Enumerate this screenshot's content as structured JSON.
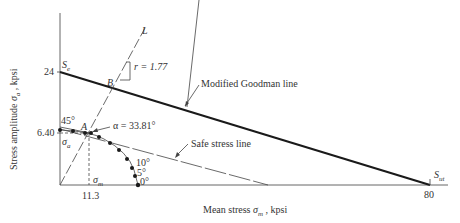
{
  "diagram": {
    "axes": {
      "x_label_prefix": "Mean stress ",
      "x_label_symbol": "σ",
      "x_label_sub": "m",
      "x_label_suffix": " , kpsi",
      "y_label_prefix": "Stress amplitude ",
      "y_label_symbol": "σ",
      "y_label_sub": "a",
      "y_label_suffix": " , kpsi"
    },
    "ticks": {
      "y_24": "24",
      "y_640": "6.40",
      "x_113": "11.3",
      "x_80": "80"
    },
    "points": {
      "Se": "S",
      "Se_sub": "e",
      "Sut": "S",
      "Sut_sub": "ut",
      "A": "A",
      "B": "B",
      "L": "L"
    },
    "annotations": {
      "slope": "r = 1.77",
      "alpha": "α = 33.81°",
      "angle45": "45°",
      "angle10": "10°",
      "angle5": "5°",
      "angle0": "0°",
      "sigma_a": "σ",
      "sigma_a_sub": "a",
      "sigma_m": "σ",
      "sigma_m_sub": "m"
    },
    "lines": {
      "goodman": "Modified Goodman line",
      "safe": "Safe stress line"
    },
    "colors": {
      "goodman_line": "#1a1a1a",
      "thin_line": "#444444",
      "dots": "#1a1a1a"
    }
  }
}
